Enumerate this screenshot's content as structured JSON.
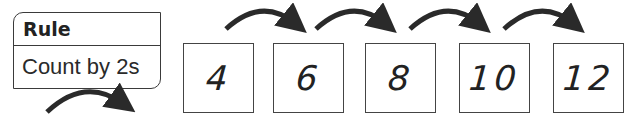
{
  "rule": {
    "header": "Rule",
    "text": "Count by 2s"
  },
  "sequence": {
    "values": [
      "4",
      "6",
      "8",
      "10",
      "12"
    ]
  },
  "icons": {
    "hop_arrow": "curved-right-arrow-icon"
  },
  "colors": {
    "ink": "#222222",
    "border": "#444444",
    "background": "#ffffff"
  }
}
